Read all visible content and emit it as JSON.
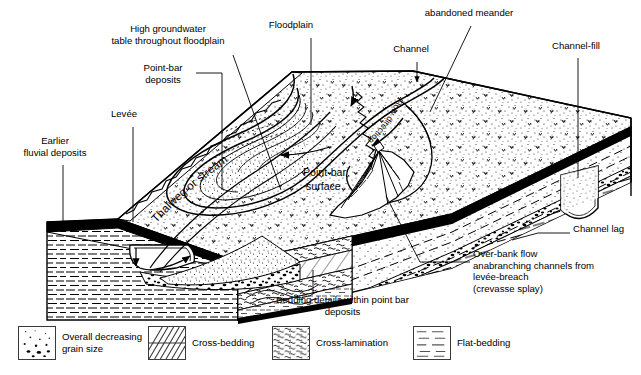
{
  "figure": {
    "ink_color": "#000000",
    "background_color": "#ffffff",
    "size": {
      "width": 641,
      "height": 375
    }
  },
  "labels": [
    {
      "id": "high-groundwater",
      "text": "High groundwater\ntable throughout floodplain",
      "x": 168,
      "y": 29,
      "align": "center"
    },
    {
      "id": "floodplain",
      "text": "Floodplain",
      "x": 291,
      "y": 25,
      "align": "center"
    },
    {
      "id": "abandoned-meander",
      "text": "abandoned meander",
      "x": 469,
      "y": 13,
      "align": "center"
    },
    {
      "id": "channel",
      "text": "Channel",
      "x": 411,
      "y": 49,
      "align": "center"
    },
    {
      "id": "channel-fill",
      "text": "Channel-fill",
      "x": 566,
      "y": 46,
      "align": "center"
    },
    {
      "id": "point-bar-deposits",
      "text": "Point-bar\ndeposits",
      "x": 163,
      "y": 68,
      "align": "center"
    },
    {
      "id": "levee",
      "text": "Levée",
      "x": 124,
      "y": 114,
      "align": "center"
    },
    {
      "id": "earlier-fluvial",
      "text": "Earlier\nfluvial deposits",
      "x": 48,
      "y": 141,
      "align": "center"
    },
    {
      "id": "channel-lag",
      "text": "Channel lag",
      "x": 573,
      "y": 229,
      "align": "left"
    },
    {
      "id": "over-bank-flow",
      "text": "Over-bank flow\nanabranching channels from\nlevée-breach\n(crevasse splay)",
      "x": 473,
      "y": 254,
      "align": "left"
    },
    {
      "id": "bedding-details",
      "text": "Bedding details within point bar\ndeposits",
      "x": 340,
      "y": 300,
      "align": "center"
    }
  ],
  "inline_annotations": [
    {
      "id": "thalweg",
      "text": "Thalweg or stream"
    },
    {
      "id": "point-bar-surface",
      "text": "Point-bar\nsurface"
    },
    {
      "id": "flow-direction",
      "text": "Flow direction"
    }
  ],
  "legend": {
    "items": [
      {
        "id": "overall-decreasing-grain-size",
        "label": "Overall decreasing\ngrain size",
        "pattern": "stipple-grain",
        "x": 18,
        "y": 0
      },
      {
        "id": "cross-bedding",
        "label": "Cross-bedding",
        "pattern": "cross-bedding",
        "x": 148,
        "y": 0
      },
      {
        "id": "cross-lamination",
        "label": "Cross-lamination",
        "pattern": "cross-lamination",
        "x": 272,
        "y": 0
      },
      {
        "id": "flat-bedding",
        "label": "Flat-bedding",
        "pattern": "flat-bedding",
        "x": 413,
        "y": 0
      }
    ]
  }
}
